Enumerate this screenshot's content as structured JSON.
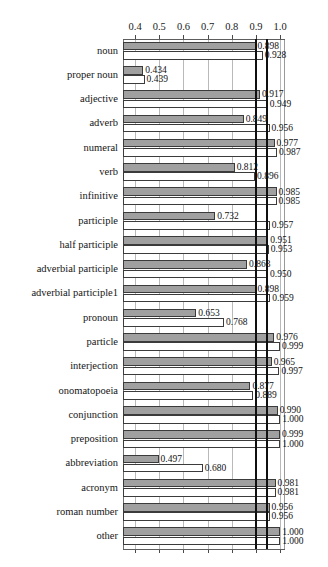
{
  "chart_data": {
    "type": "bar",
    "orientation": "horizontal",
    "title": "",
    "xlabel": "",
    "ylabel": "",
    "xlim": [
      0.35,
      1.02
    ],
    "xticks": [
      0.4,
      0.5,
      0.6,
      0.7,
      0.8,
      0.9,
      1.0
    ],
    "xtick_labels": [
      "0.4",
      "0.5",
      "0.6",
      "0.7",
      "0.8",
      "0.9",
      "1.0"
    ],
    "tick_labels_position": [
      "top",
      "bottom"
    ],
    "grid": true,
    "grid_axis": "x",
    "legend": null,
    "reference_lines": [
      0.897,
      0.94
    ],
    "categories": [
      "noun",
      "proper noun",
      "adjective",
      "adverb",
      "numeral",
      "verb",
      "infinitive",
      "participle",
      "half participle",
      "adverbial participle",
      "adverbial participle1",
      "pronoun",
      "particle",
      "interjection",
      "onomatopoeia",
      "conjunction",
      "preposition",
      "abbreviation",
      "acronym",
      "roman number",
      "other"
    ],
    "series": [
      {
        "name": "series-1",
        "style": "filled-gray",
        "values": [
          0.898,
          0.434,
          0.917,
          0.849,
          0.977,
          0.812,
          0.985,
          0.732,
          0.951,
          0.863,
          0.898,
          0.653,
          0.976,
          0.965,
          0.877,
          0.99,
          0.999,
          0.497,
          0.981,
          0.956,
          1.0
        ],
        "value_labels": [
          "0.898",
          "0.434",
          "0.917",
          "0.849",
          "0.977",
          "0.812",
          "0.985",
          "0.732",
          "0.951",
          "0.863",
          "0.898",
          "0.653",
          "0.976",
          "0.965",
          "0.877",
          "0.990",
          "0.999",
          "0.497",
          "0.981",
          "0.956",
          "1.000"
        ]
      },
      {
        "name": "series-2",
        "style": "hollow-white",
        "values": [
          0.928,
          0.439,
          0.949,
          0.956,
          0.987,
          0.896,
          0.985,
          0.957,
          0.953,
          0.95,
          0.959,
          0.768,
          0.999,
          0.997,
          0.889,
          1.0,
          1.0,
          0.68,
          0.981,
          0.956,
          1.0
        ],
        "value_labels": [
          "0.928",
          "0.439",
          "0.949",
          "0.956",
          "0.987",
          "0.896",
          "0.985",
          "0.957",
          "0.953",
          "0.950",
          "0.959",
          "0.768",
          "0.999",
          "0.997",
          "0.889",
          "1.000",
          "1.000",
          "0.680",
          "0.981",
          "0.956",
          "1.000"
        ]
      }
    ]
  }
}
